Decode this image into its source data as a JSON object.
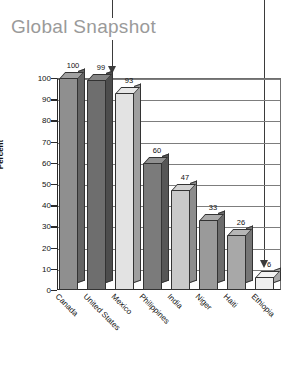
{
  "title": "Global Snapshot",
  "annotations": [
    {
      "name": "callout-arrow-to-mexico-region",
      "label": ""
    },
    {
      "name": "callout-arrow-to-ethiopia-bar",
      "label": ""
    }
  ],
  "chart_data": {
    "type": "bar",
    "title": "Global Snapshot",
    "xlabel": "",
    "ylabel": "Percent",
    "ylim": [
      0,
      100
    ],
    "ytick_labels": [
      "100",
      "90",
      "80",
      "70",
      "60",
      "50",
      "40",
      "30",
      "20",
      "10",
      "0"
    ],
    "ytick_values": [
      100,
      90,
      80,
      70,
      60,
      50,
      40,
      30,
      20,
      10,
      0
    ],
    "grid": true,
    "legend": "none",
    "style": "3d-column",
    "categories": [
      "Canada",
      "United States",
      "Mexico",
      "Philippines",
      "India",
      "Niger",
      "Haiti",
      "Ethiopia"
    ],
    "values": [
      100,
      99,
      93,
      60,
      47,
      33,
      26,
      6
    ],
    "value_labels": [
      "100",
      "99",
      "93",
      "60",
      "47",
      "33",
      "26",
      "6"
    ],
    "bar_colors": [
      "#8f8f8f",
      "#6e6e6e",
      "#e3e3e3",
      "#7b7b7b",
      "#c9c9c9",
      "#9a9a9a",
      "#a8a8a8",
      "#efefef"
    ]
  },
  "colors": {
    "title": "#9a9a9a",
    "axis": "#2b2b2b",
    "grid": "#7d7d7d",
    "arrow": "#3b3b3b",
    "background": "#ffffff"
  }
}
